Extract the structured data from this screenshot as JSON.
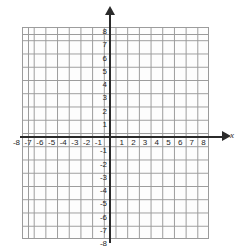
{
  "figure": {
    "axis_label_x": "x",
    "axis_label_y": ""
  },
  "chart_data": {
    "type": "scatter",
    "title": "",
    "xlabel": "x",
    "ylabel": "",
    "xlim": [
      -8,
      8
    ],
    "ylim": [
      -8,
      8
    ],
    "grid": true,
    "minor_grid": true,
    "minor_grid_step": 0.5,
    "major_grid_step": 1,
    "legend": "none",
    "series": [],
    "x_ticks": [
      -8,
      -7,
      -6,
      -5,
      -4,
      -3,
      -2,
      -1,
      1,
      2,
      3,
      4,
      5,
      6,
      7,
      8
    ],
    "y_ticks": [
      8,
      7,
      6,
      5,
      4,
      3,
      2,
      1,
      -1,
      -2,
      -3,
      -4,
      -5,
      -6,
      -7,
      -8
    ],
    "x_tick_labels": [
      "-8",
      "-7",
      "-6",
      "-5",
      "-4",
      "-3",
      "-2",
      "-1",
      "1",
      "2",
      "3",
      "4",
      "5",
      "6",
      "7",
      "8"
    ],
    "y_tick_labels": [
      "8",
      "7",
      "6",
      "5",
      "4",
      "3",
      "2",
      "1",
      "-1",
      "-2",
      "-3",
      "-4",
      "-5",
      "-6",
      "-7",
      "-8"
    ],
    "axis_color": "#2b2b2b",
    "grid_color": "#9a9a9a",
    "minor_grid_color": "#8a8a8a",
    "background": "#ffffff"
  }
}
